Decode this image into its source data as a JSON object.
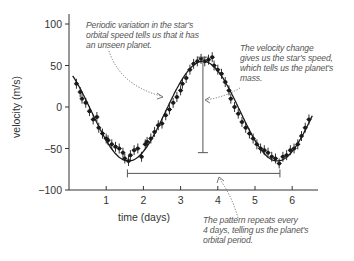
{
  "chart_data": {
    "type": "scatter",
    "title": "",
    "xlabel": "time (days)",
    "ylabel": "velocity (m/s)",
    "xlim": [
      0,
      6.6
    ],
    "ylim": [
      -100,
      100
    ],
    "xticks": [
      1,
      2,
      3,
      4,
      5,
      6
    ],
    "yticks": [
      100,
      50,
      0,
      -50,
      -100
    ],
    "ytick_labels": [
      "100",
      "50",
      "0",
      "−50",
      "−100"
    ],
    "grid": false,
    "legend": null,
    "fit_curve": {
      "description": "sinusoidal fit",
      "period_days": 4,
      "amplitude": 60,
      "offset": -5,
      "phase_day": 2.6,
      "t_range": [
        0.1,
        6.55
      ]
    },
    "series": [
      {
        "name": "measured velocity (with error bars)",
        "x": [
          0.2,
          0.3,
          0.35,
          0.45,
          0.55,
          0.65,
          0.75,
          0.8,
          0.9,
          1.0,
          1.05,
          1.15,
          1.25,
          1.35,
          1.45,
          1.5,
          1.6,
          1.65,
          1.75,
          1.85,
          1.95,
          2.05,
          2.1,
          2.2,
          2.3,
          2.4,
          2.5,
          2.6,
          2.7,
          2.8,
          2.9,
          3.0,
          3.05,
          3.15,
          3.25,
          3.35,
          3.45,
          3.55,
          3.65,
          3.75,
          3.85,
          3.9,
          4.0,
          4.1,
          4.2,
          4.3,
          4.35,
          4.45,
          4.55,
          4.65,
          4.75,
          4.85,
          4.95,
          5.05,
          5.15,
          5.25,
          5.35,
          5.45,
          5.55,
          5.65,
          5.75,
          5.85,
          5.95,
          6.05,
          6.15,
          6.25,
          6.35,
          6.45
        ],
        "y": [
          28,
          18,
          10,
          5,
          -5,
          -15,
          -12,
          -25,
          -32,
          -38,
          -40,
          -45,
          -48,
          -50,
          -55,
          -62,
          -65,
          -58,
          -52,
          -50,
          -60,
          -45,
          -42,
          -38,
          -30,
          -22,
          -20,
          -10,
          -3,
          5,
          12,
          20,
          28,
          35,
          45,
          52,
          55,
          58,
          55,
          57,
          60,
          50,
          45,
          40,
          30,
          20,
          10,
          0,
          -8,
          -18,
          -25,
          -32,
          -38,
          -45,
          -50,
          -52,
          -55,
          -60,
          -62,
          -68,
          -60,
          -58,
          -52,
          -50,
          -45,
          -35,
          -25,
          -15
        ],
        "error": 6
      }
    ],
    "brackets": [
      {
        "name": "period",
        "x_start": 1.57,
        "x_end": 5.67,
        "y": -80
      },
      {
        "name": "amplitude",
        "x": 3.6,
        "y_start": 60,
        "y_end": -55
      }
    ],
    "annotations": [
      {
        "text": "Periodic variation in the star's orbital speed tells us that it has an unseen planet.",
        "target": [
          2.55,
          12
        ]
      },
      {
        "text": "The velocity change gives us the star's speed, which tells us the planet's mass.",
        "target": [
          3.65,
          -6
        ]
      },
      {
        "text": "The pattern repeats every 4 days, telling us the planet's orbital period.",
        "target": [
          4.1,
          -78
        ]
      }
    ]
  },
  "annotations": {
    "periodic": {
      "lines": [
        "Periodic variation in the star's",
        "orbital speed tells us that it has",
        "an unseen planet."
      ]
    },
    "velocity_change": {
      "lines": [
        "The velocity change",
        "gives us the star's speed,",
        "which tells us the planet's",
        "mass."
      ]
    },
    "pattern": {
      "lines": [
        "The pattern repeats every",
        "4 days, telling us the planet's",
        "orbital period."
      ]
    }
  },
  "colors": {
    "data": "#1a1a1a",
    "axis": "#333333",
    "bracket": "#555555",
    "annotation_text": "#555555",
    "leader": "#666666"
  }
}
